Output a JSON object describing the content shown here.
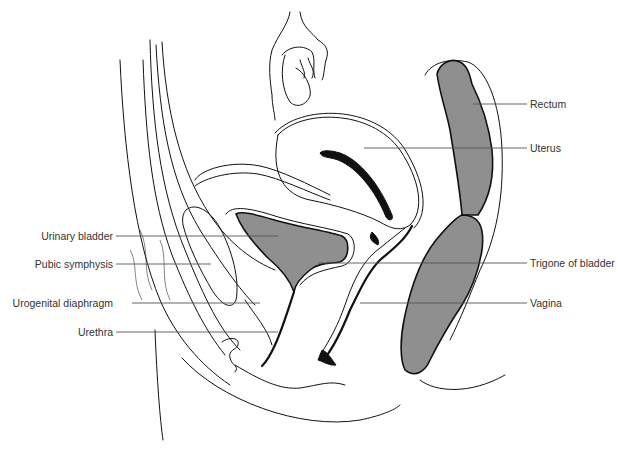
{
  "figure": {
    "fill_color": "#8f8f8f",
    "line_color": "#111111",
    "background": "#ffffff"
  },
  "labels": {
    "left": [
      {
        "id": "urinary-bladder",
        "text": "Urinary bladder"
      },
      {
        "id": "pubic-symphysis",
        "text": "Pubic symphysis"
      },
      {
        "id": "urogenital-diaphragm",
        "text": "Urogenital diaphragm"
      },
      {
        "id": "urethra",
        "text": "Urethra"
      }
    ],
    "right": [
      {
        "id": "rectum",
        "text": "Rectum"
      },
      {
        "id": "uterus",
        "text": "Uterus"
      },
      {
        "id": "trigone-of-bladder",
        "text": "Trigone of bladder"
      },
      {
        "id": "vagina",
        "text": "Vagina"
      }
    ]
  }
}
